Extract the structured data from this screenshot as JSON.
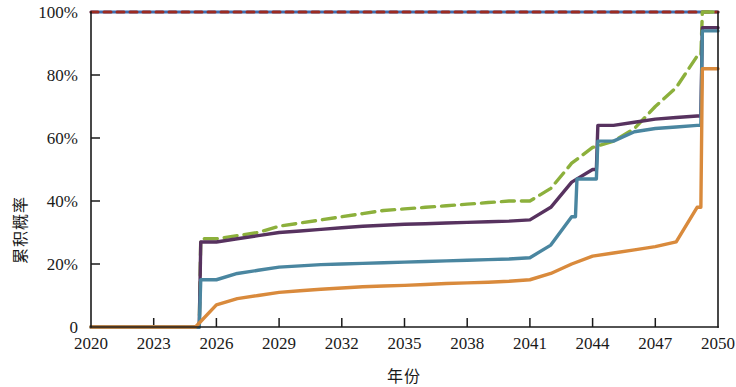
{
  "chart_data": {
    "type": "line",
    "title": "",
    "subtitle": "",
    "xlabel": "年份",
    "ylabel": "累积概率",
    "xlim": [
      2020,
      2050
    ],
    "ylim": [
      0,
      100
    ],
    "grid": false,
    "legend": "none",
    "x_ticks": [
      "2020",
      "2023",
      "2026",
      "2029",
      "2032",
      "2035",
      "2038",
      "2041",
      "2044",
      "2047",
      "2050"
    ],
    "x_tick_values": [
      2020,
      2023,
      2026,
      2029,
      2032,
      2035,
      2038,
      2041,
      2044,
      2047,
      2050
    ],
    "y_ticks": [
      "0",
      "20%",
      "40%",
      "60%",
      "80%",
      "100%"
    ],
    "y_tick_values": [
      0,
      20,
      40,
      60,
      80,
      100
    ],
    "x": [
      2020,
      2021,
      2022,
      2023,
      2024,
      2025,
      2026,
      2027,
      2028,
      2029,
      2030,
      2031,
      2032,
      2033,
      2034,
      2035,
      2036,
      2037,
      2038,
      2039,
      2040,
      2041,
      2042,
      2043,
      2044,
      2045,
      2046,
      2047,
      2048,
      2049,
      2050
    ],
    "series": [
      {
        "name": "series-top-blue",
        "color": "#3D6FB4",
        "style": "solid",
        "width": 3.0,
        "values": [
          100,
          100,
          100,
          100,
          100,
          100,
          100,
          100,
          100,
          100,
          100,
          100,
          100,
          100,
          100,
          100,
          100,
          100,
          100,
          100,
          100,
          100,
          100,
          100,
          100,
          100,
          100,
          100,
          100,
          100,
          100
        ]
      },
      {
        "name": "series-top-darkred",
        "color": "#9C2B22",
        "style": "dashed",
        "width": 3.0,
        "values": [
          100,
          100,
          100,
          100,
          100,
          100,
          100,
          100,
          100,
          100,
          100,
          100,
          100,
          100,
          100,
          100,
          100,
          100,
          100,
          100,
          100,
          100,
          100,
          100,
          100,
          100,
          100,
          100,
          100,
          100,
          100
        ]
      },
      {
        "name": "series-green",
        "color": "#8CB03C",
        "style": "dashed",
        "width": 3.4,
        "values": [
          0,
          0,
          0,
          0,
          0,
          0,
          28,
          29,
          30,
          32,
          33,
          34,
          35,
          36,
          37,
          37.5,
          38,
          38.5,
          39,
          39.5,
          40,
          40,
          44,
          52,
          57,
          59,
          63,
          70,
          76,
          86,
          100
        ]
      },
      {
        "name": "series-purple",
        "color": "#57325F",
        "style": "solid",
        "width": 3.4,
        "values": [
          0,
          0,
          0,
          0,
          0,
          0,
          27,
          28,
          29,
          30,
          30.5,
          31,
          31.5,
          32,
          32.3,
          32.6,
          32.8,
          33,
          33.2,
          33.4,
          33.6,
          34,
          38,
          46,
          50,
          64,
          65,
          66,
          66.5,
          67,
          95
        ]
      },
      {
        "name": "series-steelblue",
        "color": "#4A86A0",
        "style": "solid",
        "width": 3.4,
        "values": [
          0,
          0,
          0,
          0,
          0,
          0,
          15,
          17,
          18,
          19,
          19.4,
          19.8,
          20,
          20.2,
          20.4,
          20.6,
          20.8,
          21,
          21.2,
          21.4,
          21.6,
          22,
          26,
          35,
          47,
          59,
          62,
          63,
          63.5,
          64,
          94
        ]
      },
      {
        "name": "series-orange",
        "color": "#D98A3C",
        "style": "solid",
        "width": 3.4,
        "values": [
          0,
          0,
          0,
          0,
          0,
          0,
          7,
          9,
          10,
          11,
          11.5,
          12,
          12.4,
          12.8,
          13,
          13.2,
          13.5,
          13.8,
          14,
          14.2,
          14.5,
          15,
          17,
          20,
          22.5,
          23.5,
          24.5,
          25.5,
          27,
          38,
          82
        ]
      }
    ],
    "annotations": []
  },
  "axes": {
    "x_axis_name": "x-axis",
    "y_axis_name": "y-axis"
  }
}
